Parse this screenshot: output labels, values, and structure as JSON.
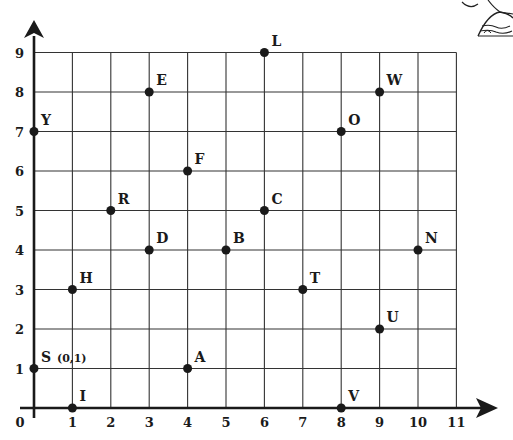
{
  "chart_data": {
    "type": "scatter",
    "title": "",
    "xlabel": "",
    "ylabel": "",
    "xlim": [
      0,
      11
    ],
    "ylim": [
      0,
      9
    ],
    "grid": true,
    "x_ticks": [
      "0",
      "1",
      "2",
      "3",
      "4",
      "5",
      "6",
      "7",
      "8",
      "9",
      "10",
      "11"
    ],
    "y_ticks": [
      "1",
      "2",
      "3",
      "4",
      "5",
      "6",
      "7",
      "8",
      "9"
    ],
    "points": [
      {
        "label": "L",
        "x": 6,
        "y": 9
      },
      {
        "label": "E",
        "x": 3,
        "y": 8
      },
      {
        "label": "W",
        "x": 9,
        "y": 8
      },
      {
        "label": "Y",
        "x": 0,
        "y": 7
      },
      {
        "label": "O",
        "x": 8,
        "y": 7
      },
      {
        "label": "F",
        "x": 4,
        "y": 6
      },
      {
        "label": "R",
        "x": 2,
        "y": 5
      },
      {
        "label": "C",
        "x": 6,
        "y": 5
      },
      {
        "label": "D",
        "x": 3,
        "y": 4
      },
      {
        "label": "B",
        "x": 5,
        "y": 4
      },
      {
        "label": "N",
        "x": 10,
        "y": 4
      },
      {
        "label": "H",
        "x": 1,
        "y": 3
      },
      {
        "label": "T",
        "x": 7,
        "y": 3
      },
      {
        "label": "U",
        "x": 9,
        "y": 2
      },
      {
        "label": "S (0,1)",
        "x": 0,
        "y": 1
      },
      {
        "label": "A",
        "x": 4,
        "y": 1
      },
      {
        "label": "I",
        "x": 1,
        "y": 0
      },
      {
        "label": "V",
        "x": 8,
        "y": 0
      }
    ]
  },
  "colors": {
    "line": "#333333",
    "axis": "#1a1a1a",
    "point": "#1a1a1a",
    "background": "#ffffff"
  },
  "decoration": "cartoon-character-corner"
}
